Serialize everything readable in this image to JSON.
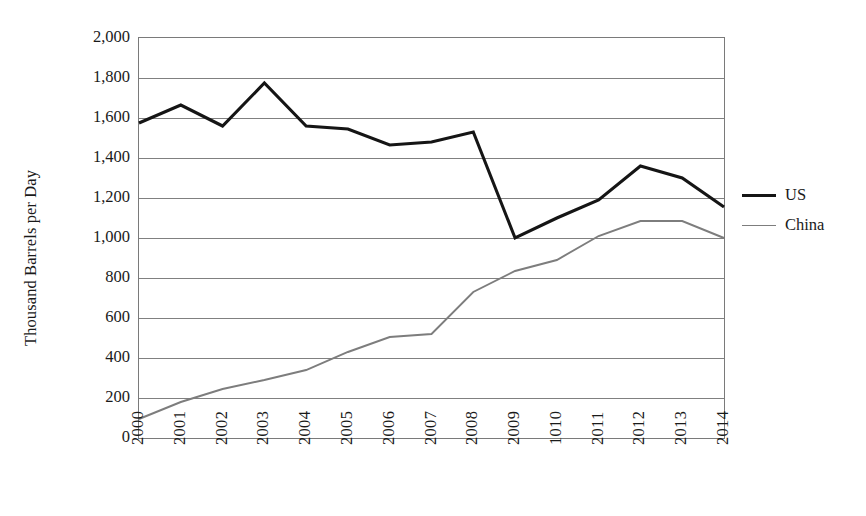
{
  "chart_data": {
    "type": "line",
    "title": "",
    "subtitle": "",
    "xlabel": "",
    "ylabel": "Thousand Barrels per Day",
    "categories": [
      "2000",
      "2001",
      "2002",
      "2003",
      "2004",
      "2005",
      "2006",
      "2007",
      "2008",
      "2009",
      "1010",
      "2011",
      "2012",
      "2013",
      "2014"
    ],
    "x_tick_labels": [
      "2000",
      "2001",
      "2002",
      "2003",
      "2004",
      "2005",
      "2006",
      "2007",
      "2008",
      "2009",
      "1010",
      "2011",
      "2012",
      "2013",
      "2014"
    ],
    "y_tick_labels": [
      "2,000",
      "1,800",
      "1,600",
      "1,400",
      "1,200",
      "1,000",
      "800",
      "600",
      "400",
      "200",
      "0"
    ],
    "y_tick_values": [
      2000,
      1800,
      1600,
      1400,
      1200,
      1000,
      800,
      600,
      400,
      200,
      0
    ],
    "ylim": [
      0,
      2000
    ],
    "y_major_step": 200,
    "grid": "horizontal",
    "legend_position": "right",
    "series": [
      {
        "name": "US",
        "color": "#151515",
        "line_width": 3.1,
        "values": [
          1575,
          1665,
          1560,
          1775,
          1560,
          1545,
          1465,
          1480,
          1530,
          1000,
          1100,
          1190,
          1360,
          1300,
          1155
        ]
      },
      {
        "name": "China",
        "color": "#7d7d7d",
        "line_width": 1.9,
        "values": [
          95,
          180,
          245,
          290,
          340,
          430,
          505,
          520,
          730,
          835,
          890,
          1010,
          1085,
          1085,
          1000
        ]
      }
    ]
  },
  "legend": {
    "items": [
      {
        "label": "US",
        "swatch": "thick-black-line"
      },
      {
        "label": "China",
        "swatch": "thin-gray-line"
      }
    ]
  },
  "axes": {
    "y_title": "Thousand Barrels per Day"
  }
}
